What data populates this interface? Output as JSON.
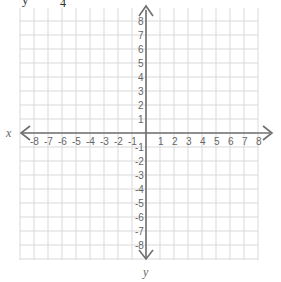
{
  "header_fragment": {
    "left_char": "y",
    "sub_char": "4",
    "mid_char": "’"
  },
  "plane": {
    "x_label": "x",
    "y_label": "y",
    "x_min": -8,
    "x_max": 8,
    "y_min": -8,
    "y_max": 8,
    "x_ticks_negative": [
      "-8",
      "-7",
      "-6",
      "-5",
      "-4",
      "-3",
      "-2",
      "-1"
    ],
    "x_ticks_positive": [
      "1",
      "2",
      "3",
      "4",
      "5",
      "6",
      "7",
      "8"
    ],
    "y_ticks_positive": [
      "1",
      "2",
      "3",
      "4",
      "5",
      "6",
      "7",
      "8"
    ],
    "y_ticks_negative": [
      "-1",
      "-2",
      "-3",
      "-4",
      "-5",
      "-6",
      "-7",
      "-8"
    ],
    "colors": {
      "grid": "#d9d9d9",
      "axis": "#6f6f6f",
      "text": "#666666"
    }
  }
}
